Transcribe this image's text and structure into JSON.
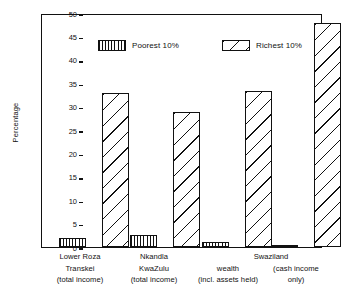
{
  "chart_data": {
    "type": "bar",
    "title": "",
    "xlabel": "",
    "ylabel": "Percentage",
    "ylim": [
      0,
      50
    ],
    "ytick_step": 5,
    "yticks": [
      "0",
      "5",
      "10",
      "15",
      "20",
      "25",
      "30",
      "35",
      "40",
      "45",
      "50"
    ],
    "grid": false,
    "legend_position": "top-inside",
    "categories": [
      "Lower Roza Transkei (total income)",
      "Nkandla KwaZulu (total income)",
      "Swaziland wealth (incl. assets held)",
      "Swaziland (cash income only)"
    ],
    "category_lines": [
      [
        "Lower Roza",
        "Transkei",
        "(total income)"
      ],
      [
        "Nkandla",
        "KwaZulu",
        "(total income)"
      ],
      [
        "wealth",
        "(incl. assets held)"
      ],
      [
        "(cash income",
        "only)"
      ]
    ],
    "group_header": {
      "label": "Swaziland",
      "spans_categories": [
        2,
        3
      ]
    },
    "series": [
      {
        "name": "Poorest 10%",
        "pattern": "vertical-hatch",
        "values": [
          2.0,
          2.5,
          1.1,
          0.3
        ]
      },
      {
        "name": "Richest 10%",
        "pattern": "diagonal-hatch",
        "values": [
          33.0,
          28.8,
          33.3,
          47.8
        ]
      }
    ]
  },
  "colors": {
    "ink": "#111111",
    "background": "#ffffff"
  }
}
